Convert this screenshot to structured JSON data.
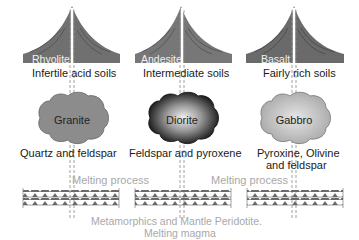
{
  "columns": [
    {
      "volcanic_rock": "Rhyolite",
      "soil": "Infertile acid soils",
      "plutonic_rock": "Granite",
      "minerals": "Quartz and feldspar"
    },
    {
      "volcanic_rock": "Andesite",
      "soil": "Intermediate soils",
      "plutonic_rock": "Diorite",
      "minerals": "Feldspar and pyroxene"
    },
    {
      "volcanic_rock": "Basalt",
      "soil": "Fairly rich soils",
      "plutonic_rock": "Gabbro",
      "minerals_line1": "Pyroxine, Olivine",
      "minerals_line2": "and feldspar"
    }
  ],
  "process_labels": [
    "Melting process",
    "Melting process"
  ],
  "base_caption": {
    "line1": "Metamorphics  and  Mantle Peridotite.",
    "line2": "Melting magma"
  },
  "colors": {
    "volcano_fill": "#707070",
    "granite_fill": "#8a8a8a",
    "diorite_dark": "#111111",
    "gabbro_fill": "#c2c2c2",
    "caption_grey": "#a8a8a8"
  }
}
